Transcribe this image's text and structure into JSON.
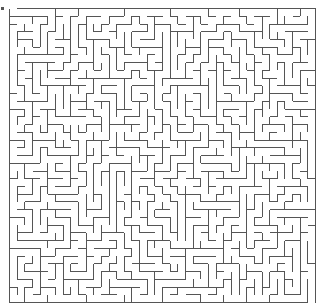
{
  "maze": {
    "type": "rectangular-grid-maze",
    "cols": 40,
    "rows": 38,
    "origin_x": 9.5,
    "origin_y": 8.5,
    "width": 306,
    "height": 294,
    "wall_color": "#555555",
    "background_color": "#ffffff",
    "wall_width": 1,
    "seed": 20240611,
    "entrance": {
      "side": "top",
      "col": 0
    },
    "exit": {
      "side": "bottom",
      "col": 39
    }
  }
}
